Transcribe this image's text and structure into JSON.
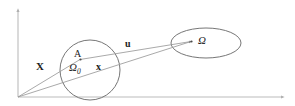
{
  "figure": {
    "name": "continuum-deformation-diagram",
    "background_color": "#ffffff",
    "stroke_color": "#7a7a7a",
    "text_color": "#1c1c1c",
    "axes": {
      "origin": [
        18,
        97
      ],
      "vertical_tip": [
        18,
        8
      ],
      "horizontal_tip": [
        285,
        97
      ],
      "color": "#b5b5b5"
    },
    "labels": {
      "reference_domain": "Ω",
      "reference_domain_subscript": "0",
      "current_domain": "Ω",
      "material_point": "A",
      "position_reference": "X",
      "position_current": "x",
      "displacement": "u"
    },
    "shapes": {
      "reference_body": {
        "type": "circle",
        "cx": 90,
        "cy": 70,
        "r": 30
      },
      "current_body": {
        "type": "ellipse",
        "cx": 206,
        "cy": 43,
        "rx": 35,
        "ry": 15
      }
    },
    "vectors": [
      {
        "name": "X",
        "from": [
          18,
          97
        ],
        "to": [
          81,
          59
        ],
        "label": "X"
      },
      {
        "name": "x",
        "from": [
          18,
          97
        ],
        "to": [
          192,
          41
        ],
        "label": "x"
      },
      {
        "name": "u",
        "from": [
          81,
          59
        ],
        "to": [
          192,
          41
        ],
        "label": "u"
      }
    ],
    "points": [
      {
        "name": "A",
        "at": [
          81,
          59
        ]
      },
      {
        "name": "omega-point",
        "at": [
          192,
          41
        ]
      }
    ]
  }
}
